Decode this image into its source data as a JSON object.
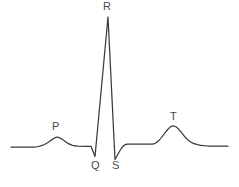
{
  "figure": {
    "background_color": "#ffffff",
    "stroke_color": "#3a3a3a",
    "label_color": "#4a4a4a",
    "width": 239,
    "height": 187
  },
  "labels": {
    "p": "P",
    "q": "Q",
    "r": "R",
    "s": "S",
    "t": "T"
  },
  "chart_data": {
    "type": "line",
    "title": "",
    "xlabel": "",
    "ylabel": "",
    "grid": false,
    "legend": "none",
    "xlim": [
      0,
      239
    ],
    "ylim": [
      187,
      0
    ],
    "annotations": [
      {
        "label": "P",
        "x": 57,
        "y": 137,
        "text_x": 52,
        "text_y": 121
      },
      {
        "label": "Q",
        "x": 95,
        "y": 156,
        "text_x": 91,
        "text_y": 160
      },
      {
        "label": "R",
        "x": 108,
        "y": 17,
        "text_x": 103,
        "text_y": 1
      },
      {
        "label": "S",
        "x": 115,
        "y": 159,
        "text_x": 112,
        "text_y": 160
      },
      {
        "label": "T",
        "x": 173,
        "y": 126,
        "text_x": 170,
        "text_y": 111
      }
    ],
    "series": [
      {
        "name": "ecg-trace",
        "x": [
          11,
          24,
          34,
          42,
          48,
          53,
          57,
          62,
          67,
          72,
          78,
          86,
          92,
          95,
          108,
          115,
          121,
          126,
          138,
          150,
          158,
          165,
          173,
          181,
          188,
          195,
          205,
          218,
          228
        ],
        "y": [
          147,
          147,
          147,
          146,
          143,
          139,
          137,
          139,
          142,
          145,
          146,
          146,
          146,
          156,
          17,
          159,
          149,
          144,
          144,
          144,
          141,
          133,
          126,
          132,
          139,
          143,
          145,
          146,
          146
        ]
      }
    ]
  },
  "path_d": "M 11,147 L 24,147 L 34,147 C 40,147 44,145 48,142.5 C 52,139.5 55,137 57,137 C 60,137 63.5,140 67,142.8 C 70.5,145.2 74,146 78,146.2 L 86,146.3 L 91,146.3 L 95,156.5 L 108,17 L 115,159.5 L 120,150.5 C 122.5,146.5 124.5,144.5 127,144.2 L 140,144.2 L 152,144.2 C 157,144 161,138.5 166,131.5 C 169.5,127 171.5,125.8 173.5,125.8 C 176,125.8 178,128 181,131.8 C 185,137.5 189,141.8 194,143.6 C 198,145 202,145.8 208,146 L 228,146"
}
